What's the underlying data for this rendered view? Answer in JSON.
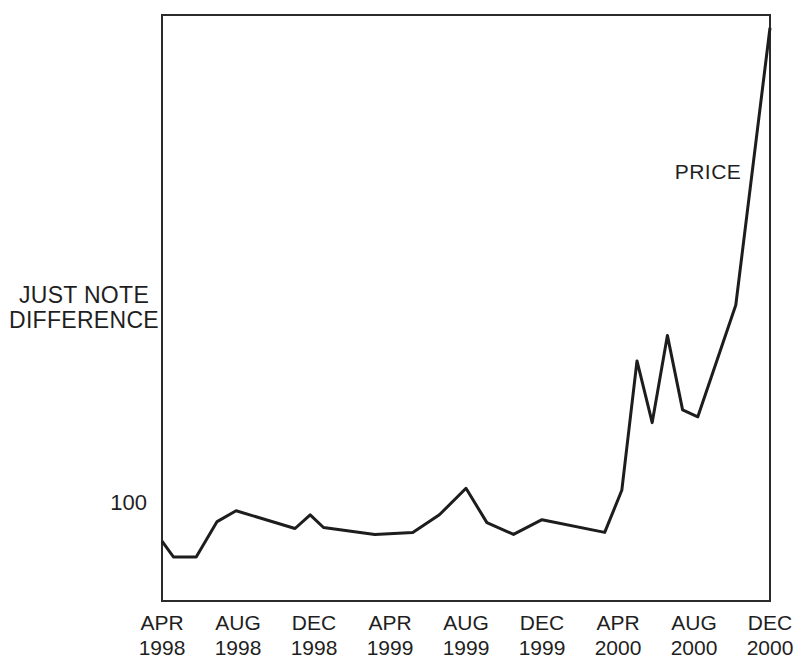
{
  "chart_data": {
    "type": "line",
    "title": "",
    "ylabel_lines": [
      "JUST NOTE",
      "DIFFERENCE"
    ],
    "xlabel": "",
    "y_tick_labels": [
      {
        "value": 100,
        "label": "100"
      }
    ],
    "ylim": [
      0,
      600
    ],
    "grid": false,
    "legend_position": "inline-annotation",
    "x_axis": {
      "unit": "months",
      "start": "APR 1998",
      "end": "DEC 2000",
      "months_total": 32,
      "tick_interval_months": 4
    },
    "x_tick_labels": [
      {
        "month": "APR",
        "year": "1998"
      },
      {
        "month": "AUG",
        "year": "1998"
      },
      {
        "month": "DEC",
        "year": "1998"
      },
      {
        "month": "APR",
        "year": "1999"
      },
      {
        "month": "AUG",
        "year": "1999"
      },
      {
        "month": "DEC",
        "year": "1999"
      },
      {
        "month": "APR",
        "year": "2000"
      },
      {
        "month": "AUG",
        "year": "2000"
      },
      {
        "month": "DEC",
        "year": "2000"
      }
    ],
    "series": [
      {
        "name": "PRICE",
        "points": [
          {
            "month_index": 0,
            "value": 61
          },
          {
            "month_index": 0.6,
            "value": 45
          },
          {
            "month_index": 1.8,
            "value": 45
          },
          {
            "month_index": 2.9,
            "value": 81
          },
          {
            "month_index": 3.9,
            "value": 92
          },
          {
            "month_index": 7.0,
            "value": 74
          },
          {
            "month_index": 7.8,
            "value": 88
          },
          {
            "month_index": 8.5,
            "value": 75
          },
          {
            "month_index": 11.2,
            "value": 68
          },
          {
            "month_index": 13.2,
            "value": 70
          },
          {
            "month_index": 14.6,
            "value": 88
          },
          {
            "month_index": 16.0,
            "value": 115
          },
          {
            "month_index": 17.1,
            "value": 80
          },
          {
            "month_index": 18.5,
            "value": 68
          },
          {
            "month_index": 20.0,
            "value": 83
          },
          {
            "month_index": 23.3,
            "value": 70
          },
          {
            "month_index": 24.2,
            "value": 113
          },
          {
            "month_index": 25.0,
            "value": 245
          },
          {
            "month_index": 25.8,
            "value": 182
          },
          {
            "month_index": 26.6,
            "value": 271
          },
          {
            "month_index": 27.4,
            "value": 195
          },
          {
            "month_index": 28.2,
            "value": 188
          },
          {
            "month_index": 30.2,
            "value": 302
          },
          {
            "month_index": 32.0,
            "value": 585
          }
        ]
      }
    ]
  },
  "colors": {
    "ink": "#1f1f1f",
    "line": "#1d1d1d",
    "border": "#2b2b2b",
    "background": "#ffffff"
  }
}
